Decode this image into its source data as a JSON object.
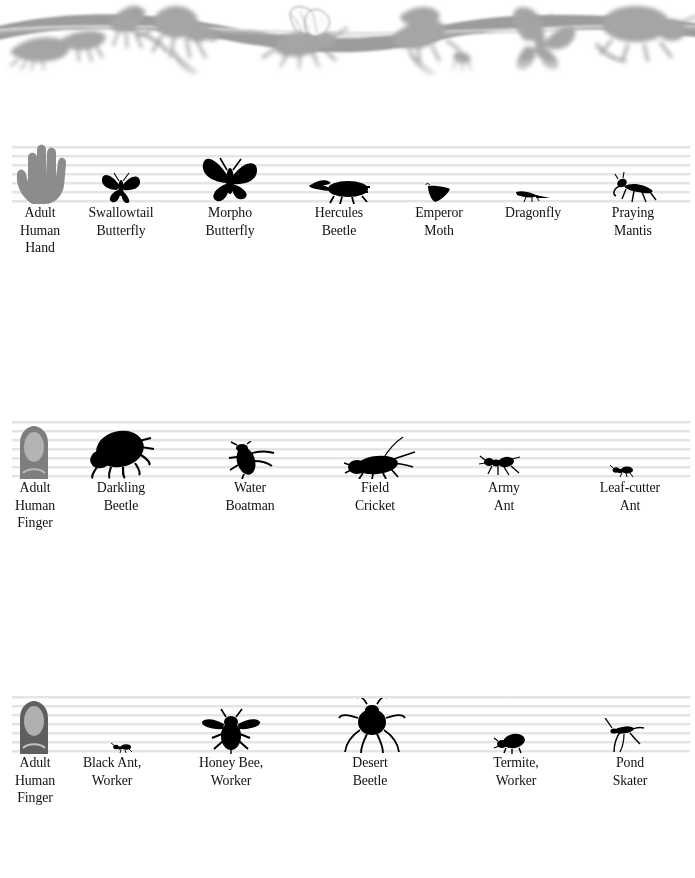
{
  "page": {
    "background_color": "#ffffff",
    "text_color": "#111111",
    "rule_line_color": "#e3e3e3",
    "silhouette_color": "#000000",
    "reference_figure_color": "#8a8a8a"
  },
  "banner": {
    "name": "decorative-insect-border",
    "description": "Grayscale wavy ribbon with insect silhouettes",
    "ribbon_color": "#9a9a9a",
    "insect_color": "#a8a8a8"
  },
  "rows": [
    {
      "id": "row-1",
      "reference": {
        "label": "Adult\nHuman\nHand",
        "icon": "hand-silhouette"
      },
      "items": [
        {
          "label": "Adult\nHuman\nHand",
          "icon": "hand-silhouette"
        },
        {
          "label": "Swallowtail\nButterfly",
          "icon": "swallowtail-butterfly-silhouette"
        },
        {
          "label": "Morpho\nButterfly",
          "icon": "morpho-butterfly-silhouette"
        },
        {
          "label": "Hercules\nBeetle",
          "icon": "hercules-beetle-silhouette"
        },
        {
          "label": "Emperor\nMoth",
          "icon": "emperor-moth-silhouette"
        },
        {
          "label": "Dragonfly",
          "icon": "dragonfly-silhouette"
        },
        {
          "label": "Praying\nMantis",
          "icon": "praying-mantis-silhouette"
        }
      ]
    },
    {
      "id": "row-2",
      "reference": {
        "label": "Adult\nHuman\nFinger",
        "icon": "finger-silhouette"
      },
      "items": [
        {
          "label": "Adult\nHuman\nFinger",
          "icon": "finger-silhouette"
        },
        {
          "label": "Darkling\nBeetle",
          "icon": "darkling-beetle-silhouette"
        },
        {
          "label": "Water\nBoatman",
          "icon": "water-boatman-silhouette"
        },
        {
          "label": "Field\nCricket",
          "icon": "field-cricket-silhouette"
        },
        {
          "label": "Army\nAnt",
          "icon": "army-ant-silhouette"
        },
        {
          "label": "Leaf-cutter\nAnt",
          "icon": "leaf-cutter-ant-silhouette"
        }
      ]
    },
    {
      "id": "row-3",
      "reference": {
        "label": "Adult\nHuman\nFinger",
        "icon": "finger-silhouette"
      },
      "items": [
        {
          "label": "Adult\nHuman\nFinger",
          "icon": "finger-silhouette"
        },
        {
          "label": "Black Ant,\nWorker",
          "icon": "black-ant-worker-silhouette"
        },
        {
          "label": "Honey Bee,\nWorker",
          "icon": "honey-bee-worker-silhouette"
        },
        {
          "label": "Desert\nBeetle",
          "icon": "desert-beetle-silhouette"
        },
        {
          "label": "Termite,\nWorker",
          "icon": "termite-worker-silhouette"
        },
        {
          "label": "Pond\nSkater",
          "icon": "pond-skater-silhouette"
        }
      ]
    }
  ]
}
